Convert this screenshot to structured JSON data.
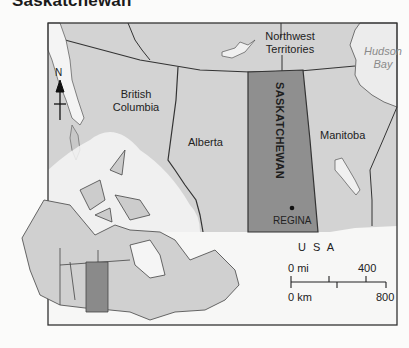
{
  "title": "Saskatchewan",
  "map": {
    "regions": {
      "northwest_territories": "Northwest Territories",
      "nwt_line1": "Northwest",
      "nwt_line2": "Territories",
      "hudson_line1": "Hudson",
      "hudson_line2": "Bay",
      "bc_line1": "British",
      "bc_line2": "Columbia",
      "alberta": "Alberta",
      "saskatchewan": "SASKATCHEWAN",
      "manitoba": "Manitoba",
      "usa": "U S A"
    },
    "city": {
      "name": "REGINA",
      "marker": "capital-dot"
    },
    "north_arrow": {
      "label": "N",
      "icon": "north-arrow-icon"
    },
    "scale_bar": {
      "mi_start": "0 mi",
      "mi_end": "400",
      "km_start": "0 km",
      "km_end": "800"
    },
    "inset": {
      "description": "Canada locator map with Saskatchewan highlighted"
    },
    "colors": {
      "highlight": "#8c8c8c",
      "province_fill": "#cfcfcf",
      "water": "#f2f2f2",
      "border": "#333333"
    }
  }
}
